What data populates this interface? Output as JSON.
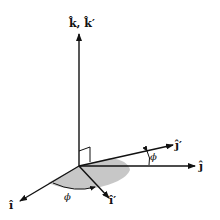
{
  "diagram": {
    "labels": {
      "k_axis": "k̂, k̂′",
      "j_axis": "ĵ",
      "j_prime_axis": "ĵ′",
      "i_axis": "î",
      "i_prime_axis": "î′",
      "phi_top": "ϕ",
      "phi_bottom": "ϕ"
    },
    "colors": {
      "line": "#111111",
      "shade": "#b8b8b8"
    }
  }
}
